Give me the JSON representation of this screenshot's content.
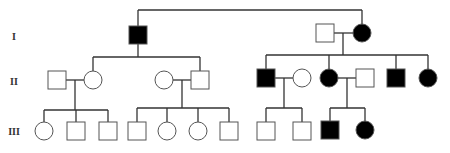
{
  "diagram": {
    "type": "pedigree",
    "generation_labels": [
      "I",
      "II",
      "III"
    ],
    "colors": {
      "affected_fill": "#000000",
      "unaffected_fill": "#ffffff",
      "line": "#333333",
      "outline": "#555555"
    },
    "individuals": [
      {
        "id": "I-1",
        "sex": "male",
        "affected": true,
        "x": 138,
        "y": 35
      },
      {
        "id": "I-2",
        "sex": "male",
        "affected": false,
        "x": 325,
        "y": 33
      },
      {
        "id": "I-3",
        "sex": "female",
        "affected": true,
        "x": 362,
        "y": 33
      },
      {
        "id": "II-1",
        "sex": "male",
        "affected": false,
        "x": 57,
        "y": 80
      },
      {
        "id": "II-2",
        "sex": "female",
        "affected": false,
        "x": 93,
        "y": 80
      },
      {
        "id": "II-3",
        "sex": "female",
        "affected": false,
        "x": 164,
        "y": 80
      },
      {
        "id": "II-4",
        "sex": "male",
        "affected": false,
        "x": 200,
        "y": 80
      },
      {
        "id": "II-5",
        "sex": "male",
        "affected": true,
        "x": 266,
        "y": 78
      },
      {
        "id": "II-6",
        "sex": "female",
        "affected": false,
        "x": 302,
        "y": 78
      },
      {
        "id": "II-7",
        "sex": "female",
        "affected": true,
        "x": 329,
        "y": 78
      },
      {
        "id": "II-8",
        "sex": "male",
        "affected": false,
        "x": 365,
        "y": 78
      },
      {
        "id": "II-9",
        "sex": "male",
        "affected": true,
        "x": 396,
        "y": 78
      },
      {
        "id": "II-10",
        "sex": "female",
        "affected": true,
        "x": 428,
        "y": 78
      },
      {
        "id": "III-1",
        "sex": "female",
        "affected": false,
        "x": 44,
        "y": 131
      },
      {
        "id": "III-2",
        "sex": "male",
        "affected": false,
        "x": 76,
        "y": 131
      },
      {
        "id": "III-3",
        "sex": "male",
        "affected": false,
        "x": 108,
        "y": 131
      },
      {
        "id": "III-4",
        "sex": "male",
        "affected": false,
        "x": 137,
        "y": 131
      },
      {
        "id": "III-5",
        "sex": "female",
        "affected": false,
        "x": 167,
        "y": 131
      },
      {
        "id": "III-6",
        "sex": "female",
        "affected": false,
        "x": 198,
        "y": 131
      },
      {
        "id": "III-7",
        "sex": "male",
        "affected": false,
        "x": 229,
        "y": 131
      },
      {
        "id": "III-8",
        "sex": "male",
        "affected": false,
        "x": 266,
        "y": 131
      },
      {
        "id": "III-9",
        "sex": "male",
        "affected": false,
        "x": 302,
        "y": 131
      },
      {
        "id": "III-10",
        "sex": "male",
        "affected": true,
        "x": 330,
        "y": 130
      },
      {
        "id": "III-11",
        "sex": "female",
        "affected": true,
        "x": 365,
        "y": 130
      }
    ],
    "lines": [
      [
        138,
        10,
        362,
        10
      ],
      [
        138,
        10,
        138,
        26
      ],
      [
        362,
        10,
        362,
        24
      ],
      [
        138,
        44,
        138,
        57
      ],
      [
        93,
        57,
        200,
        57
      ],
      [
        93,
        57,
        93,
        71
      ],
      [
        200,
        57,
        200,
        71
      ],
      [
        334,
        33,
        353,
        33
      ],
      [
        343,
        33,
        343,
        55
      ],
      [
        266,
        55,
        428,
        55
      ],
      [
        266,
        55,
        266,
        69
      ],
      [
        329,
        55,
        329,
        69
      ],
      [
        396,
        55,
        396,
        69
      ],
      [
        428,
        55,
        428,
        69
      ],
      [
        66,
        80,
        84,
        80
      ],
      [
        75,
        80,
        75,
        110
      ],
      [
        44,
        110,
        108,
        110
      ],
      [
        44,
        110,
        44,
        122
      ],
      [
        76,
        110,
        76,
        122
      ],
      [
        108,
        110,
        108,
        122
      ],
      [
        173,
        80,
        191,
        80
      ],
      [
        182,
        80,
        182,
        108
      ],
      [
        137,
        108,
        229,
        108
      ],
      [
        137,
        108,
        137,
        122
      ],
      [
        167,
        108,
        167,
        122
      ],
      [
        198,
        108,
        198,
        122
      ],
      [
        229,
        108,
        229,
        122
      ],
      [
        275,
        78,
        293,
        78
      ],
      [
        284,
        78,
        284,
        108
      ],
      [
        266,
        108,
        302,
        108
      ],
      [
        266,
        108,
        266,
        122
      ],
      [
        302,
        108,
        302,
        122
      ],
      [
        338,
        78,
        356,
        78
      ],
      [
        347,
        78,
        347,
        108
      ],
      [
        330,
        108,
        365,
        108
      ],
      [
        330,
        108,
        330,
        121
      ],
      [
        365,
        108,
        365,
        121
      ]
    ]
  }
}
